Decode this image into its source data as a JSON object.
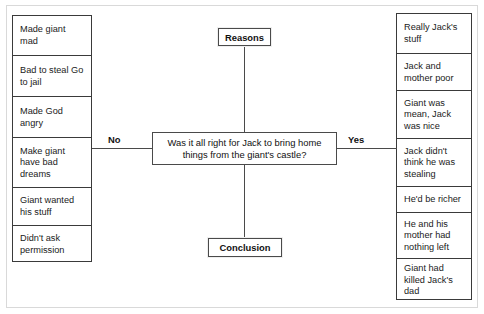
{
  "diagram": {
    "title_center": "Was it all right for Jack to bring home things from the giant's castle?",
    "top_node": "Reasons",
    "bottom_node": "Conclusion",
    "branch_left_label": "No",
    "branch_right_label": "Yes",
    "left_column": [
      "Made giant mad",
      "Bad to steal Go to jail",
      "Made God angry",
      "Make giant have bad dreams",
      "Giant wanted his stuff",
      "Didn't ask permission"
    ],
    "right_column": [
      "Really Jack's stuff",
      "Jack and mother poor",
      "Giant was mean, Jack was nice",
      "Jack didn't think he was stealing",
      "He'd be richer",
      "He and his mother had nothing left",
      "Giant had killed Jack's dad"
    ]
  },
  "colors": {
    "line": "#4a4a4a",
    "text": "#111111",
    "background": "#ffffff",
    "frame": "#d9d9d9"
  }
}
